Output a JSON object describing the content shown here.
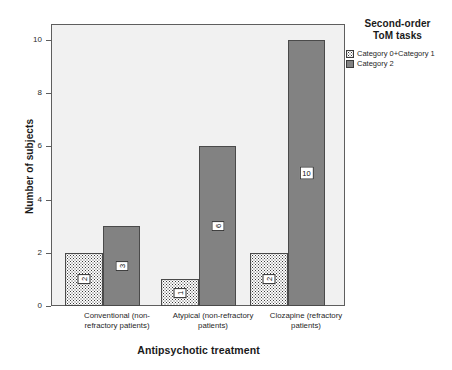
{
  "chart_data": {
    "type": "bar",
    "title": "",
    "xlabel": "Antipsychotic treatment",
    "ylabel": "Number of subjects",
    "categories": [
      "Conventional (non-refractory patients)",
      "Atypical (non-refractory patients)",
      "Clozapine (refractory patients)"
    ],
    "category_lines": [
      [
        "Conventional (non-",
        "refractory patients)"
      ],
      [
        "Atypical (non-refractory",
        "patients)"
      ],
      [
        "Clozapine (refractory",
        "patients)"
      ]
    ],
    "series": [
      {
        "name": "Category 0+Category 1",
        "values": [
          2,
          1,
          2
        ]
      },
      {
        "name": "Category 2",
        "values": [
          3,
          6,
          10
        ]
      }
    ],
    "ylim": [
      0,
      10.6
    ],
    "yticks": [
      0,
      2,
      4,
      6,
      8,
      10
    ],
    "ytick_labels": [
      "0",
      "2",
      "4",
      "6",
      "8",
      "10"
    ],
    "grid": false,
    "legend_position": "right-top",
    "legend_title": "Second-order ToM tasks",
    "legend_title_lines": [
      "Second-order",
      "ToM tasks"
    ],
    "data_labels": [
      {
        "text": "2",
        "rotated": true
      },
      {
        "text": "3",
        "rotated": true
      },
      {
        "text": "1",
        "rotated": true
      },
      {
        "text": "6",
        "rotated": true
      },
      {
        "text": "2",
        "rotated": true
      },
      {
        "text": "10",
        "rotated": false
      }
    ],
    "colors": {
      "category_1_fill": "#ffffff",
      "category_1_pattern": "#3a3a3a",
      "category_2_fill": "#828282",
      "plot_background": "#f1f1f1",
      "axis": "#5e5e5e",
      "bar_outline": "#4a4a4a",
      "text": "#1a1a1a"
    }
  },
  "axes": {
    "y_title": "Number of subjects",
    "x_title": "Antipsychotic treatment"
  },
  "legend": {
    "title_line_1": "Second-order",
    "title_line_2": "ToM tasks",
    "items": [
      {
        "label": "Category 0+Category 1",
        "swatch": "dotted-swatch-icon"
      },
      {
        "label": "Category 2",
        "swatch": "gray-swatch-icon"
      }
    ]
  },
  "ticks": {
    "y": [
      "10",
      "8",
      "6",
      "4",
      "2",
      "0"
    ]
  },
  "x_labels": [
    {
      "line1": "Conventional (non-",
      "line2": "refractory patients)"
    },
    {
      "line1": "Atypical (non-refractory",
      "line2": "patients)"
    },
    {
      "line1": "Clozapine (refractory",
      "line2": "patients)"
    }
  ],
  "values": {
    "g1c1": "2",
    "g1c2": "3",
    "g2c1": "1",
    "g2c2": "6",
    "g3c1": "2",
    "g3c2": "10"
  }
}
